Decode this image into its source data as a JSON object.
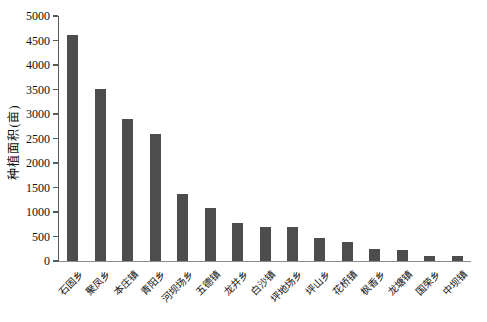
{
  "chart_data": {
    "type": "bar",
    "title": "",
    "xlabel": "",
    "ylabel": "种植面积(亩)",
    "ylim": [
      0,
      5000
    ],
    "yticks": [
      0,
      500,
      1000,
      1500,
      2000,
      2500,
      3000,
      3500,
      4000,
      4500,
      5000
    ],
    "grid": false,
    "legend": "none",
    "bar_color": "#4d4d4d",
    "categories": [
      "石固乡",
      "聚凤乡",
      "本庄镇",
      "青阳乡",
      "河坝场乡",
      "五德镇",
      "龙井乡",
      "白沙镇",
      "坪地场乡",
      "坪山乡",
      "花桥镇",
      "枫香乡",
      "龙塘镇",
      "国荣乡",
      "中坝镇"
    ],
    "values": [
      4620,
      3510,
      2890,
      2600,
      1370,
      1090,
      780,
      700,
      690,
      460,
      390,
      240,
      215,
      110,
      100
    ]
  }
}
